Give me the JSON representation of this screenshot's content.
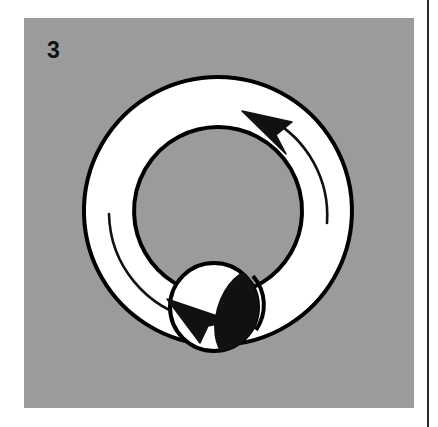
{
  "figure": {
    "number": "3",
    "caption_visible": false,
    "panel": {
      "background_color": "#9b9b9b",
      "x": 24,
      "y": 18,
      "width": 390,
      "height": 390
    },
    "label": {
      "text": "3",
      "color": "#111111",
      "x": 47,
      "y": 39,
      "font_size_px": 23,
      "bold": true
    }
  },
  "diagram": {
    "type": "rotation-annulus-with-sphere",
    "colors": {
      "ring_fill": "#ffffff",
      "outline": "#000000",
      "shadow": "#111111",
      "background": "#9b9b9b",
      "sphere_fill": "#ffffff"
    },
    "ring": {
      "name": "outer-ring",
      "center_x": 194,
      "center_y": 193,
      "outer_radius": 134,
      "inner_radius": 84,
      "outline_width": 4
    },
    "sphere": {
      "name": "bottom-sphere",
      "center_x": 190,
      "center_y": 290,
      "radius": 44,
      "outline_width": 4
    },
    "shadow_ellipse": {
      "name": "sphere-shadow",
      "center_x": 218,
      "center_y": 298,
      "rx": 26,
      "ry": 44,
      "rotation_deg": 18
    },
    "arrows": [
      {
        "name": "upper-arrow",
        "direction": "counterclockwise",
        "tip_x": 228,
        "tip_y": 97,
        "tail_end_angle_deg": 12
      },
      {
        "name": "lower-arrow",
        "direction": "clockwise-tail",
        "tip_x": 208,
        "tip_y": 300,
        "tail_end_angle_deg": 193
      }
    ],
    "guide_lines": [
      {
        "name": "upper-arc-guide",
        "start_angle_deg": 300,
        "end_angle_deg": 355
      },
      {
        "name": "lower-arc-guide",
        "start_angle_deg": 178,
        "end_angle_deg": 128
      }
    ]
  },
  "rule": {
    "name": "page-divider",
    "color": "#2a2a2a",
    "x": 427,
    "width": 2
  }
}
